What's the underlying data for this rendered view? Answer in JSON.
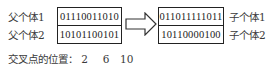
{
  "parents": {
    "labels": [
      "父个体1",
      "父个体2"
    ],
    "values": [
      "01110011010",
      "10101100101"
    ]
  },
  "children": {
    "labels": [
      "子个体1",
      "子个体2"
    ],
    "values": [
      "011011111011",
      "10110000100"
    ]
  },
  "crossover": {
    "label": "交叉点的位置：",
    "positions": [
      "2",
      "6",
      "10"
    ]
  },
  "arrow": {
    "icon": "right-arrow-icon",
    "color": "#333333"
  }
}
